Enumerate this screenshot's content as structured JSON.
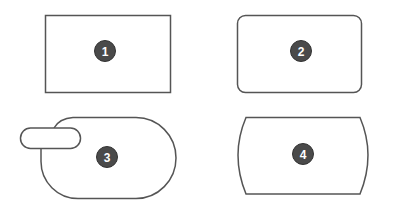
{
  "diagram": {
    "stroke_color": "#555555",
    "badge_fill": "#4a4a4a",
    "badge_text_color": "#ffffff",
    "shapes": [
      {
        "id": 1,
        "label": "1",
        "kind": "rectangle"
      },
      {
        "id": 2,
        "label": "2",
        "kind": "rounded-rectangle"
      },
      {
        "id": 3,
        "label": "3",
        "kind": "stadium-with-tab"
      },
      {
        "id": 4,
        "label": "4",
        "kind": "rectangle-with-convex-sides"
      }
    ]
  }
}
